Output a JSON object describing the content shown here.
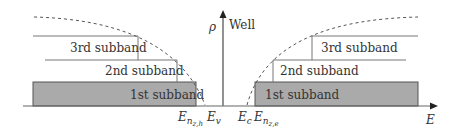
{
  "axes": {
    "y_label": "ρ",
    "y_note": "Well",
    "x_label": "E"
  },
  "subbands": {
    "first": "1st subband",
    "second": "2nd subband",
    "third": "3rd subband"
  },
  "energy_labels": {
    "e_nzh": {
      "main": "E",
      "sub": "n",
      "subsub": "z,h"
    },
    "e_v": {
      "main": "E",
      "sub": "v"
    },
    "e_c": {
      "main": "E",
      "sub": "c"
    },
    "e_nze": {
      "main": "E",
      "sub": "n",
      "subsub": "z,e"
    }
  },
  "colors": {
    "fill": "#a9a9a9",
    "line": "#555555",
    "axis": "#777777"
  }
}
